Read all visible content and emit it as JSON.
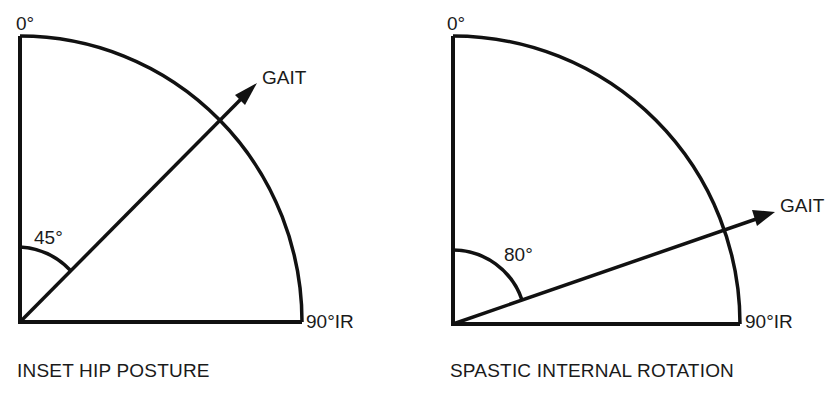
{
  "diagrams": [
    {
      "caption": "INSET HIP POSTURE",
      "top_label": "0°",
      "right_label": "90°IR",
      "arrow_label": "GAIT",
      "angle_label": "45°",
      "angle_deg": 45
    },
    {
      "caption": "SPASTIC INTERNAL ROTATION",
      "top_label": "0°",
      "right_label": "90°IR",
      "arrow_label": "GAIT",
      "angle_label": "80°",
      "angle_deg": 80
    }
  ]
}
